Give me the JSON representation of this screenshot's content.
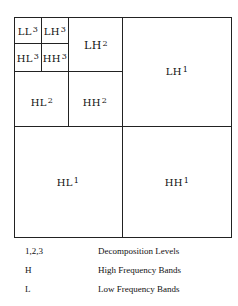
{
  "diagram": {
    "subbands": [
      {
        "id": "LL3",
        "base": "LL",
        "level": "3"
      },
      {
        "id": "LH3",
        "base": "LH",
        "level": "3"
      },
      {
        "id": "HL3",
        "base": "HL",
        "level": "3"
      },
      {
        "id": "HH3",
        "base": "HH",
        "level": "3"
      },
      {
        "id": "LH2",
        "base": "LH",
        "level": "2"
      },
      {
        "id": "HL2",
        "base": "HL",
        "level": "2"
      },
      {
        "id": "HH2",
        "base": "HH",
        "level": "2"
      },
      {
        "id": "LH1",
        "base": "LH",
        "level": "1"
      },
      {
        "id": "HL1",
        "base": "HL",
        "level": "1"
      },
      {
        "id": "HH1",
        "base": "HH",
        "level": "1"
      }
    ]
  },
  "legend": [
    {
      "key": "1,2,3",
      "description": "Decomposition Levels"
    },
    {
      "key": "H",
      "description": "High Frequency Bands"
    },
    {
      "key": "L",
      "description": "Low Frequency Bands"
    }
  ]
}
